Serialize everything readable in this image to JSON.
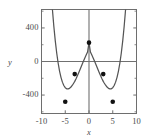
{
  "chart_data": {
    "type": "line",
    "title": "",
    "xlabel": "x",
    "ylabel": "y",
    "xlim": [
      -10,
      10
    ],
    "ylim": [
      -620,
      620
    ],
    "xticks": [
      -10,
      -5,
      0,
      5,
      10
    ],
    "xticklabels": [
      "-10",
      "-5",
      "0",
      "5",
      "10"
    ],
    "yticks": [
      -400,
      0,
      400
    ],
    "yticklabels": [
      "-400",
      "0",
      "400"
    ],
    "grid": false,
    "legend": null,
    "series": [
      {
        "name": "quartic-curve",
        "color": "#555555",
        "x": [
          -7.7,
          -7.4,
          -7.1,
          -6.8,
          -6.5,
          -6.2,
          -5.9,
          -5.6,
          -5.3,
          -5.0,
          -4.7,
          -4.4,
          -4.1,
          -3.8,
          -3.5,
          -3.2,
          -3.0,
          -2.7,
          -2.4,
          -2.1,
          -1.8,
          -1.5,
          -1.2,
          -0.9,
          -0.6,
          -0.3,
          0.0,
          0.3,
          0.6,
          0.9,
          1.2,
          1.5,
          1.8,
          2.1,
          2.4,
          2.7,
          3.0,
          3.2,
          3.5,
          3.8,
          4.1,
          4.4,
          4.7,
          5.0,
          5.3,
          5.6,
          5.9,
          6.2,
          6.5,
          6.8,
          7.1,
          7.4,
          7.7
        ],
        "y": [
          620,
          418,
          246,
          101,
          -18,
          -114,
          -189,
          -246,
          -286,
          -312,
          -325,
          -327,
          -320,
          -305,
          -283,
          -256,
          -237,
          -202,
          -164,
          -124,
          -83,
          -41,
          0,
          40,
          78,
          113,
          225,
          113,
          78,
          40,
          0,
          -41,
          -83,
          -124,
          -164,
          -202,
          -237,
          -256,
          -283,
          -305,
          -320,
          -327,
          -325,
          -312,
          -286,
          -246,
          -189,
          -114,
          -18,
          101,
          246,
          418,
          620
        ]
      }
    ],
    "markers": [
      {
        "name": "local-maximum",
        "x": 0,
        "y": 225
      },
      {
        "name": "inflection-left",
        "x": -3,
        "y": -150
      },
      {
        "name": "inflection-right",
        "x": 3,
        "y": -150
      },
      {
        "name": "local-minimum-left",
        "x": -5,
        "y": -480
      },
      {
        "name": "local-minimum-right",
        "x": 5,
        "y": -480
      }
    ],
    "marker_color": "#111111",
    "frame_color": "#6e6e6e",
    "axis_color": "#707070"
  }
}
